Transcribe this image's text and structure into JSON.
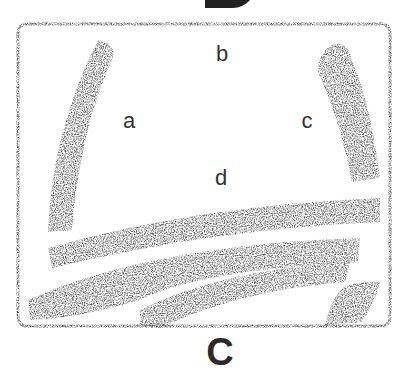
{
  "figure": {
    "top_label": "B",
    "bottom_label": "C",
    "region_labels": {
      "a": "a",
      "b": "b",
      "c": "c",
      "d": "d"
    },
    "colors": {
      "ink": "#2a2a2a",
      "background": "#ffffff",
      "stroke": "#3a3a3a"
    }
  }
}
